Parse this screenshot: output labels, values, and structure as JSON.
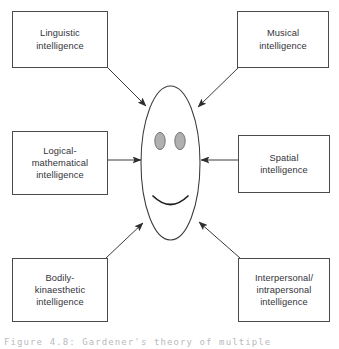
{
  "figure": {
    "caption": "Figure 4.8: Gardener's theory of multiple"
  },
  "center": {
    "name": "smiling-face",
    "eye_fill": "#b0b0b0",
    "outline_color": "#3a3a3a"
  },
  "nodes": [
    {
      "id": "linguistic",
      "label": "Linguistic\nintelligence",
      "position": "top-left"
    },
    {
      "id": "musical",
      "label": "Musical\nintelligence",
      "position": "top-right"
    },
    {
      "id": "logical-mathematical",
      "label": "Logical-\nmathematical\nintelligence",
      "position": "middle-left"
    },
    {
      "id": "spatial",
      "label": "Spatial\nintelligence",
      "position": "middle-right"
    },
    {
      "id": "bodily-kinaesthetic",
      "label": "Bodily-\nkinaesthetic\nintelligence",
      "position": "bottom-left"
    },
    {
      "id": "interpersonal-intrapersonal",
      "label": "Interpersonal/\nintrapersonal\nintelligence",
      "position": "bottom-right"
    }
  ],
  "arrows": [
    {
      "id": "arrow-linguistic-to-face",
      "from": "linguistic",
      "to": "smiling-face",
      "direction": "down-right"
    },
    {
      "id": "arrow-musical-to-face",
      "from": "musical",
      "to": "smiling-face",
      "direction": "down-left"
    },
    {
      "id": "arrow-logical-to-face",
      "from": "logical-mathematical",
      "to": "smiling-face",
      "direction": "right"
    },
    {
      "id": "arrow-spatial-to-face",
      "from": "spatial",
      "to": "smiling-face",
      "direction": "left"
    },
    {
      "id": "arrow-bodily-to-face",
      "from": "bodily-kinaesthetic",
      "to": "smiling-face",
      "direction": "up-right"
    },
    {
      "id": "arrow-interpersonal-to-face",
      "from": "interpersonal-intrapersonal",
      "to": "smiling-face",
      "direction": "up-left"
    }
  ],
  "colors": {
    "line": "#3a3a3a",
    "box_border": "#4a4a4a",
    "text": "#33333a",
    "eye_fill": "#b0b0b0",
    "caption_text": "#b9b9bd",
    "background": "#ffffff"
  }
}
